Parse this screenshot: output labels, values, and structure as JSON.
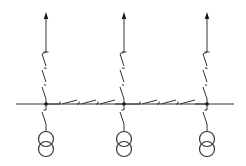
{
  "diagram": {
    "type": "single-line electrical diagram",
    "colors": {
      "line": "#333333",
      "node": "#111111",
      "background": "#ffffff"
    },
    "bus": {
      "y": 104,
      "x_start": 16,
      "x_end": 234
    },
    "bays": [
      {
        "id": "bay-1",
        "x": 46,
        "outgoing_switches": 3,
        "transformer": true
      },
      {
        "id": "bay-2",
        "x": 124,
        "outgoing_switches": 3,
        "transformer": true
      },
      {
        "id": "bay-3",
        "x": 207,
        "outgoing_switches": 3,
        "transformer": true
      }
    ],
    "bus_sections": [
      {
        "id": "section-1-2",
        "from_x": 46,
        "to_x": 124,
        "switches": 3
      },
      {
        "id": "section-2-3",
        "from_x": 124,
        "to_x": 207,
        "switches": 3
      }
    ],
    "labels": []
  }
}
